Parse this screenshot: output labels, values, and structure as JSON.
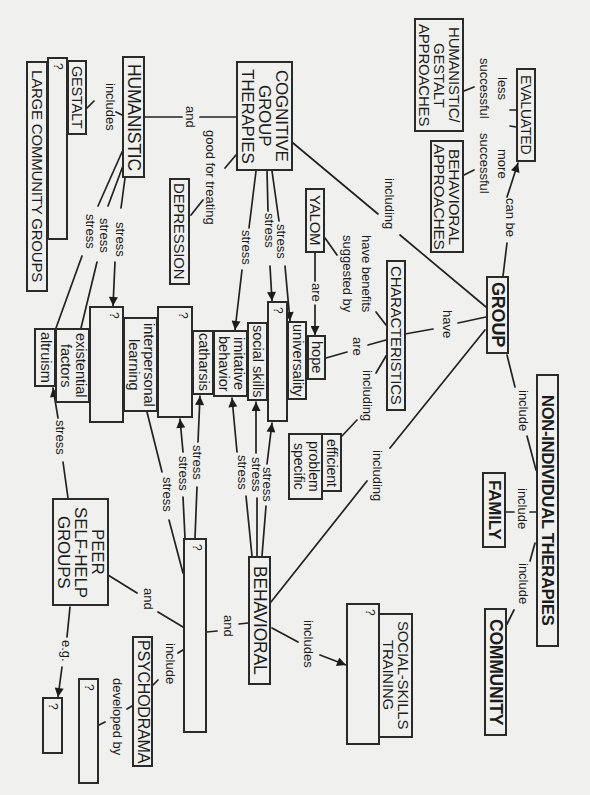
{
  "nodes": {
    "cognitive_group_therapies": "COGNITIVE\nGROUP\nTHERAPIES",
    "humanistic": "HUMANISTIC",
    "gestalt": "GESTALT",
    "unknown_humanistic_type": "?",
    "large_community_groups": "LARGE COMMUNITY GROUPS",
    "depression": "DEPRESSION",
    "humanistic_gestalt_approaches": "HUMANISTIC/\nGESTALT\nAPPROACHES",
    "evaluated": "EVALUATED",
    "behavioral_approaches": "BEHAVIORAL\nAPPROACHES",
    "yalom": "YALOM",
    "characteristics": "CHARACTERISTICS",
    "group": "GROUP",
    "non_individual_therapies": "NON-INDIVIDUAL THERAPIES",
    "family": "FAMILY",
    "community": "COMMUNITY",
    "hope": "hope",
    "universality": "universality",
    "unknown_factor_1": "?",
    "social_skills": "social skills",
    "imitative_behavior": "imitative\nbehavior",
    "catharsis": "catharsis",
    "unknown_factor_2": "?",
    "interpersonal_learning": "interpersonal\nlearning",
    "unknown_factor_3": "?",
    "existential_factors": "existential\nfactors",
    "altruism": "altruism",
    "efficient": "efficient",
    "problem_specific": "problem\nspecific",
    "behavioral": "BEHAVIORAL",
    "unknown_therapy": "?",
    "peer_self_help_groups": "PEER\nSELF-HELP\nGROUPS",
    "psychodrama": "PSYCHODRAMA",
    "unknown_developer": "?",
    "unknown_example": "?",
    "unknown_behavioral_type": "?",
    "social_skills_training": "SOCIAL-SKILLS\nTRAINING"
  },
  "links": {
    "hum_cog_and": "and",
    "cog_depression": "good for treating",
    "hum_includes": "includes",
    "hum_stress_1": "stress",
    "hum_stress_2": "stress",
    "hum_stress_3": "stress",
    "cog_stress_1": "stress",
    "cog_stress_2": "stress",
    "cog_stress_3": "stress",
    "group_including_cog": "including",
    "less_successful": "less\nsuccessful",
    "more_successful": "more\nsuccessful",
    "can_be": "can be",
    "yalom_benefits": "have benefits\nsuggested by",
    "yalom_are": "are",
    "char_are": "are",
    "char_including": "including",
    "group_have": "have",
    "group_include": "include",
    "group_including_beh": "including",
    "nonind_include_family": "include",
    "nonind_include_community": "include",
    "q4_stress_1": "stress",
    "q4_stress_2": "stress",
    "q4_stress_3": "stress",
    "beh_stress_1": "stress",
    "beh_stress_2": "stress",
    "beh_stress_3": "stress",
    "peer_stress": "stress",
    "peer_and": "and",
    "beh_and": "and",
    "q4_include": "include",
    "developed_by": "developed by",
    "eg": "e.g.",
    "beh_includes": "includes"
  },
  "edges": [
    {
      "from": "GROUP",
      "label": "can be",
      "to": "EVALUATED"
    },
    {
      "from": "EVALUATED",
      "label": "less successful",
      "to": "HUMANISTIC/GESTALT APPROACHES"
    },
    {
      "from": "EVALUATED",
      "label": "more successful",
      "to": "BEHAVIORAL APPROACHES"
    },
    {
      "from": "GROUP",
      "label": "including",
      "to": "COGNITIVE GROUP THERAPIES"
    },
    {
      "from": "GROUP",
      "label": "including",
      "to": "BEHAVIORAL"
    },
    {
      "from": "GROUP",
      "label": "have",
      "to": "CHARACTERISTICS"
    },
    {
      "from": "GROUP",
      "label": "include",
      "to": "NON-INDIVIDUAL THERAPIES"
    },
    {
      "from": "NON-INDIVIDUAL THERAPIES",
      "label": "include",
      "to": "FAMILY"
    },
    {
      "from": "NON-INDIVIDUAL THERAPIES",
      "label": "include",
      "to": "COMMUNITY"
    },
    {
      "from": "CHARACTERISTICS",
      "label": "have benefits suggested by",
      "to": "YALOM"
    },
    {
      "from": "YALOM",
      "label": "are",
      "to": "hope"
    },
    {
      "from": "CHARACTERISTICS",
      "label": "are",
      "to": "hope"
    },
    {
      "from": "CHARACTERISTICS",
      "label": "including",
      "to": "efficient / problem specific"
    },
    {
      "from": "COGNITIVE GROUP THERAPIES",
      "label": "and",
      "to": "HUMANISTIC"
    },
    {
      "from": "COGNITIVE GROUP THERAPIES",
      "label": "good for treating",
      "to": "DEPRESSION"
    },
    {
      "from": "COGNITIVE GROUP THERAPIES",
      "label": "stress",
      "to": "imitative behavior"
    },
    {
      "from": "COGNITIVE GROUP THERAPIES",
      "label": "stress",
      "to": "?"
    },
    {
      "from": "COGNITIVE GROUP THERAPIES",
      "label": "stress",
      "to": "universality"
    },
    {
      "from": "HUMANISTIC",
      "label": "includes",
      "to": "GESTALT"
    },
    {
      "from": "HUMANISTIC",
      "label": "stress",
      "to": "?"
    },
    {
      "from": "HUMANISTIC",
      "label": "stress",
      "to": "existential factors"
    },
    {
      "from": "HUMANISTIC",
      "label": "stress",
      "to": "altruism"
    },
    {
      "from": "BEHAVIORAL",
      "label": "stress",
      "to": "imitative behavior"
    },
    {
      "from": "BEHAVIORAL",
      "label": "stress",
      "to": "social skills"
    },
    {
      "from": "BEHAVIORAL",
      "label": "stress",
      "to": "?"
    },
    {
      "from": "BEHAVIORAL",
      "label": "includes",
      "to": "? / SOCIAL-SKILLS TRAINING"
    },
    {
      "from": "BEHAVIORAL",
      "label": "and",
      "to": "?"
    },
    {
      "from": "?",
      "label": "stress",
      "to": "?"
    },
    {
      "from": "?",
      "label": "stress",
      "to": "catharsis"
    },
    {
      "from": "?",
      "label": "stress",
      "to": "interpersonal learning"
    },
    {
      "from": "?",
      "label": "include",
      "to": "PSYCHODRAMA"
    },
    {
      "from": "PSYCHODRAMA",
      "label": "developed by",
      "to": "?"
    },
    {
      "from": "PEER SELF-HELP GROUPS",
      "label": "and",
      "to": "?"
    },
    {
      "from": "PEER SELF-HELP GROUPS",
      "label": "stress",
      "to": "altruism"
    },
    {
      "from": "PEER SELF-HELP GROUPS",
      "label": "e.g.",
      "to": "?"
    }
  ]
}
